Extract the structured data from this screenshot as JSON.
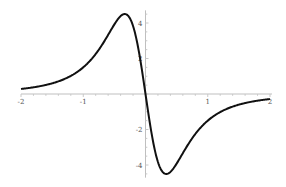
{
  "chart_data": {
    "type": "line",
    "title": "",
    "xlabel": "",
    "ylabel": "",
    "xlim": [
      -2,
      2
    ],
    "ylim": [
      -4.6,
      4.6
    ],
    "grid": false,
    "legend": null,
    "x_ticks": [
      -2,
      -1,
      1,
      2
    ],
    "y_ticks": [
      4,
      2,
      -2,
      -4
    ],
    "x_tick_labels": [
      "-2",
      "-1",
      "1",
      "2"
    ],
    "y_tick_labels": [
      "4",
      "2",
      "-2",
      "-4"
    ],
    "series": [
      {
        "name": "f(x)",
        "color": "#111111",
        "x": [
          -2.0,
          -1.75,
          -1.5,
          -1.25,
          -1.0,
          -0.8,
          -0.6,
          -0.5,
          -0.4,
          -0.33,
          -0.25,
          -0.15,
          -0.08,
          0.0,
          0.08,
          0.15,
          0.25,
          0.33,
          0.4,
          0.5,
          0.6,
          0.8,
          1.0,
          1.25,
          1.5,
          1.75,
          2.0
        ],
        "y": [
          0.28,
          0.41,
          0.62,
          0.99,
          1.5,
          2.3,
          3.4,
          4.0,
          4.42,
          4.5,
          4.25,
          3.05,
          1.76,
          0.0,
          -1.76,
          -3.05,
          -4.25,
          -4.5,
          -4.42,
          -4.0,
          -3.4,
          -2.3,
          -1.5,
          -0.99,
          -0.62,
          -0.41,
          -0.28
        ]
      }
    ]
  },
  "plot": {
    "width": 286,
    "height": 187,
    "origin_px": [
      145.5,
      94
    ],
    "x_unit_px": 62.25,
    "y_unit_px": 17.75,
    "axis_color": "#bfbfbf",
    "label_color": "#555555"
  }
}
